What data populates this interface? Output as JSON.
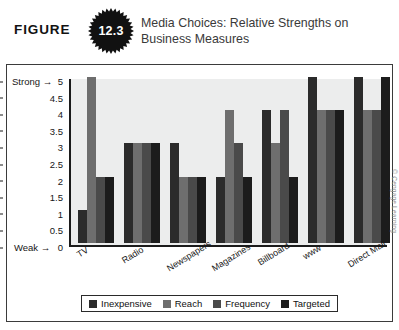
{
  "header": {
    "figure_word": "FIGURE",
    "figure_number": "12.3",
    "title": "Media Choices: Relative Strengths on Business Measures"
  },
  "credit": "© Cengage Learning",
  "axis": {
    "y_top_label": "Strong",
    "y_bottom_label": "Weak",
    "y_arrow": "→"
  },
  "chart_data": {
    "type": "bar",
    "title": "Media Choices: Relative Strengths on Business Measures",
    "xlabel": "",
    "ylabel": "",
    "ylim": [
      0,
      5
    ],
    "yticks": [
      "0",
      "0.5",
      "1",
      "1.5",
      "2",
      "2.5",
      "3",
      "3.5",
      "4",
      "4.5",
      "5"
    ],
    "ytick_values": [
      0,
      0.5,
      1,
      1.5,
      2,
      2.5,
      3,
      3.5,
      4,
      4.5,
      5
    ],
    "grid": false,
    "legend_position": "bottom",
    "categories": [
      "TV",
      "Radio",
      "Newspapers",
      "Magazines",
      "Billboard",
      "www",
      "Direct Mail"
    ],
    "series": [
      {
        "name": "Inexpensive",
        "color": "#2b2b2b",
        "values": [
          1,
          3,
          3,
          2,
          4,
          5,
          5
        ]
      },
      {
        "name": "Reach",
        "color": "#6e6e6e",
        "values": [
          5,
          3,
          2,
          4,
          3,
          4,
          4
        ]
      },
      {
        "name": "Frequency",
        "color": "#4a4a4a",
        "values": [
          2,
          3,
          2,
          3,
          4,
          4,
          4
        ]
      },
      {
        "name": "Targeted",
        "color": "#1c1c1c",
        "values": [
          2,
          3,
          2,
          2,
          2,
          4,
          5
        ]
      }
    ]
  }
}
